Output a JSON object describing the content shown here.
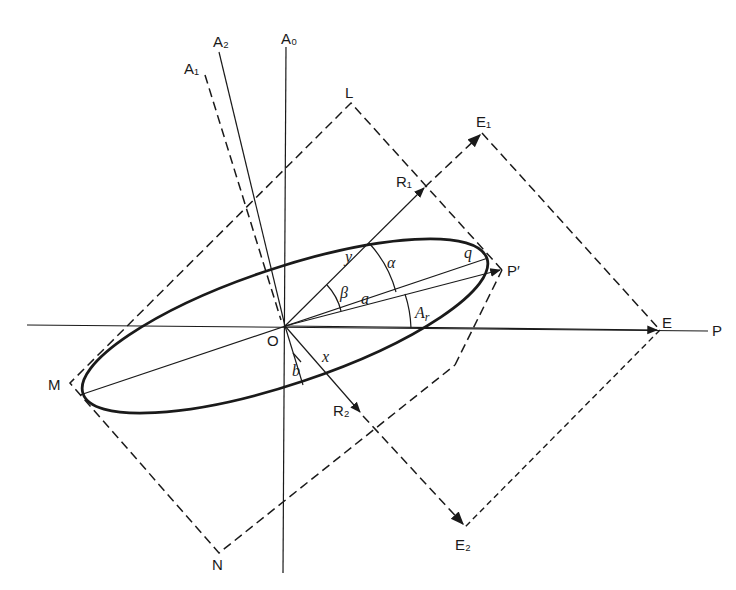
{
  "diagram": {
    "points": {
      "A0": "A₀",
      "A1": "A₁",
      "A2": "A₂",
      "L": "L",
      "M": "M",
      "N": "N",
      "E": "E",
      "E1": "E₁",
      "E2": "E₂",
      "R1": "R₁",
      "R2": "R₂",
      "P": "P",
      "P_prime": "P′",
      "O": "O"
    },
    "symbols": {
      "alpha": "α",
      "beta": "β",
      "a": "a",
      "b": "b",
      "q": "q",
      "x": "x",
      "y": "y",
      "Ar": "A",
      "Ar_sub": "r"
    },
    "colors": {
      "ink": "#1a1a1a",
      "background": "#ffffff"
    }
  }
}
